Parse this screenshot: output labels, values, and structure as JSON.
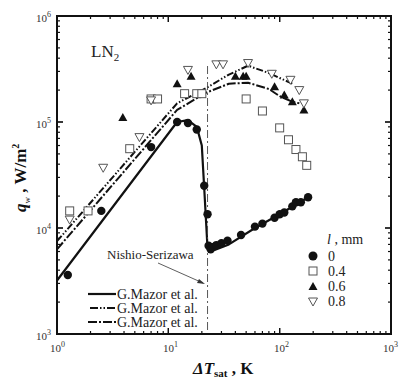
{
  "chart_data": {
    "type": "scatter",
    "title": "",
    "annotation_fluid": "LN2",
    "xlabel": "ΔT_sat , K",
    "ylabel": "q_w , W/m²",
    "xscale": "log",
    "yscale": "log",
    "xlim": [
      1,
      1000
    ],
    "ylim": [
      1000,
      1000000
    ],
    "x_ticks": [
      "10^0",
      "10^1",
      "10^2",
      "10^3"
    ],
    "y_ticks": [
      "10^3",
      "10^4",
      "10^5",
      "10^6"
    ],
    "grid": false,
    "legend_title": "l , mm",
    "legend_position": "lower right",
    "series": [
      {
        "name": "0",
        "marker": "filled-circle",
        "connected": true,
        "points": [
          [
            1.25,
            3600
          ],
          [
            2.5,
            14500
          ],
          [
            7,
            58000
          ],
          [
            12,
            100000
          ],
          [
            15,
            98000
          ],
          [
            18,
            85000
          ],
          [
            21,
            25000
          ],
          [
            22.5,
            13500
          ],
          [
            23,
            6800
          ],
          [
            24,
            6300
          ],
          [
            25,
            6600
          ],
          [
            27,
            6900
          ],
          [
            30,
            7200
          ],
          [
            34,
            7600
          ],
          [
            45,
            8600
          ],
          [
            60,
            10300
          ],
          [
            70,
            11000
          ],
          [
            90,
            12500
          ],
          [
            100,
            13500
          ],
          [
            110,
            14000
          ],
          [
            130,
            16000
          ],
          [
            140,
            17500
          ],
          [
            155,
            17500
          ],
          [
            180,
            19500
          ]
        ]
      },
      {
        "name": "0.4",
        "marker": "open-square",
        "connected": false,
        "points": [
          [
            1.3,
            14500
          ],
          [
            1.9,
            14500
          ],
          [
            4.5,
            56000
          ],
          [
            7,
            165000
          ],
          [
            8,
            165000
          ],
          [
            14,
            185000
          ],
          [
            18,
            185000
          ],
          [
            20,
            185000
          ],
          [
            50,
            165000
          ],
          [
            70,
            127000
          ],
          [
            100,
            88000
          ],
          [
            120,
            68000
          ],
          [
            140,
            55000
          ],
          [
            160,
            47000
          ],
          [
            175,
            39000
          ]
        ]
      },
      {
        "name": "0.6",
        "marker": "filled-triangle-up",
        "connected": false,
        "points": [
          [
            3.9,
            110000
          ],
          [
            12,
            230000
          ],
          [
            16,
            270000
          ],
          [
            40,
            270000
          ],
          [
            47,
            270000
          ],
          [
            50,
            270000
          ],
          [
            90,
            215000
          ],
          [
            110,
            180000
          ],
          [
            130,
            155000
          ],
          [
            165,
            130000
          ]
        ]
      },
      {
        "name": "0.8",
        "marker": "open-triangle-down",
        "connected": false,
        "points": [
          [
            1.3,
            12000
          ],
          [
            2.6,
            37000
          ],
          [
            5.5,
            72000
          ],
          [
            7,
            160000
          ],
          [
            15,
            310000
          ],
          [
            27,
            350000
          ],
          [
            31,
            350000
          ],
          [
            52,
            360000
          ],
          [
            85,
            285000
          ],
          [
            125,
            250000
          ],
          [
            150,
            200000
          ],
          [
            165,
            150000
          ]
        ]
      }
    ],
    "lines": [
      {
        "name": "G.Mazor et al.",
        "style": "solid",
        "points": [
          [
            1,
            3200
          ],
          [
            12,
            100000
          ],
          [
            15,
            104000
          ],
          [
            18,
            90000
          ],
          [
            20,
            60000
          ],
          [
            21,
            24000
          ],
          [
            22.5,
            6500
          ],
          [
            24,
            6000
          ],
          [
            35,
            7000
          ],
          [
            60,
            10000
          ],
          [
            100,
            13500
          ],
          [
            180,
            19500
          ]
        ]
      },
      {
        "name": "G.Mazor et al.",
        "style": "dash-dot-dot",
        "points": [
          [
            1,
            7500
          ],
          [
            12,
            150000
          ],
          [
            22,
            210000
          ],
          [
            35,
            280000
          ],
          [
            52,
            340000
          ],
          [
            80,
            290000
          ],
          [
            100,
            260000
          ],
          [
            130,
            230000
          ]
        ]
      },
      {
        "name": "G.Mazor et al.",
        "style": "dash-dot",
        "points": [
          [
            1,
            6300
          ],
          [
            12,
            130000
          ],
          [
            22,
            190000
          ],
          [
            35,
            230000
          ],
          [
            52,
            235000
          ],
          [
            80,
            205000
          ],
          [
            100,
            175000
          ],
          [
            130,
            155000
          ],
          [
            150,
            150000
          ]
        ]
      },
      {
        "name": "Nishio-Serizawa",
        "style": "dash-dot-vertical",
        "x": 22.5
      }
    ]
  },
  "text": {
    "fluid_label_main": "LN",
    "fluid_label_sub": "2",
    "y_axis_q": "q",
    "y_axis_sub": "w",
    "y_axis_unit": " , W/m",
    "y_axis_sup": "2",
    "x_axis_delta": "ΔT",
    "x_axis_sub": "sat",
    "x_axis_unit": " , K",
    "x_tick_0": "10",
    "x_tick_0_exp": "0",
    "x_tick_1": "10",
    "x_tick_1_exp": "1",
    "x_tick_2": "10",
    "x_tick_2_exp": "2",
    "x_tick_3": "10",
    "x_tick_3_exp": "3",
    "y_tick_3": "10",
    "y_tick_3_exp": "3",
    "y_tick_4": "10",
    "y_tick_4_exp": "4",
    "y_tick_5": "10",
    "y_tick_5_exp": "5",
    "y_tick_6": "10",
    "y_tick_6_exp": "6",
    "nishio_label": "Nishio-Serizawa",
    "legend_line_1": "G.Mazor et al.",
    "legend_line_2": "G.Mazor et al.",
    "legend_line_3": "G.Mazor et al.",
    "legend_title_l": "l",
    "legend_title_unit": " , mm",
    "legend_marker_1": "0",
    "legend_marker_2": "0.4",
    "legend_marker_3": "0.6",
    "legend_marker_4": "0.8"
  }
}
